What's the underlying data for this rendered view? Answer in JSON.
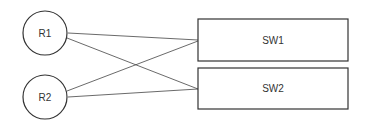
{
  "diagram": {
    "nodes": [
      {
        "id": "R1",
        "label": "R1",
        "shape": "circle"
      },
      {
        "id": "R2",
        "label": "R2",
        "shape": "circle"
      },
      {
        "id": "SW1",
        "label": "SW1",
        "shape": "rectangle"
      },
      {
        "id": "SW2",
        "label": "SW2",
        "shape": "rectangle"
      }
    ],
    "edges": [
      {
        "from": "R1",
        "to": "SW1"
      },
      {
        "from": "R1",
        "to": "SW2"
      },
      {
        "from": "R2",
        "to": "SW1"
      },
      {
        "from": "R2",
        "to": "SW2"
      }
    ],
    "colors": {
      "stroke": "#333333",
      "background": "#ffffff"
    }
  }
}
